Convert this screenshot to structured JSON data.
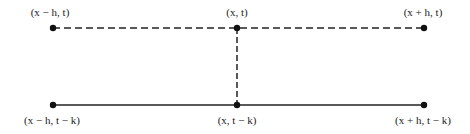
{
  "diagram": {
    "title": "",
    "nodes": [
      {
        "id": "top-left",
        "label": "(x − h, t)",
        "x": 53,
        "y": 28
      },
      {
        "id": "top-center",
        "label": "(x, t)",
        "x": 237,
        "y": 28
      },
      {
        "id": "top-right",
        "label": "(x + h, t)",
        "x": 424,
        "y": 28
      },
      {
        "id": "bottom-left",
        "label": "(x − h, t − k)",
        "x": 53,
        "y": 105
      },
      {
        "id": "bottom-center",
        "label": "(x, t − k)",
        "x": 237,
        "y": 105
      },
      {
        "id": "bottom-right",
        "label": "(x + h, t − k)",
        "x": 424,
        "y": 105
      }
    ],
    "edges": [
      {
        "from": "top-left",
        "to": "top-right",
        "style": "dashed"
      },
      {
        "from": "top-center",
        "to": "bottom-center",
        "style": "dashed"
      },
      {
        "from": "bottom-left",
        "to": "bottom-right",
        "style": "solid"
      }
    ],
    "colors": {
      "line": "#222222",
      "background": "#ffffff"
    }
  }
}
